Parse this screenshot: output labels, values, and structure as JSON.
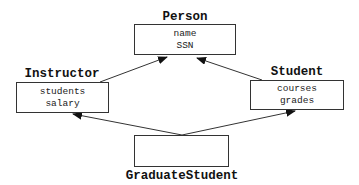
{
  "diagram": {
    "type": "class-inheritance",
    "classes": [
      {
        "id": "person",
        "name": "Person",
        "attributes": [
          "name",
          "SSN"
        ]
      },
      {
        "id": "instructor",
        "name": "Instructor",
        "attributes": [
          "students",
          "salary"
        ]
      },
      {
        "id": "student",
        "name": "Student",
        "attributes": [
          "courses",
          "grades"
        ]
      },
      {
        "id": "graduate_student",
        "name": "GraduateStudent",
        "attributes": []
      }
    ],
    "edges": [
      {
        "from": "Instructor",
        "to": "Person",
        "kind": "inherits"
      },
      {
        "from": "Student",
        "to": "Person",
        "kind": "inherits"
      },
      {
        "from": "GraduateStudent",
        "to": "Instructor",
        "kind": "inherits"
      },
      {
        "from": "GraduateStudent",
        "to": "Student",
        "kind": "inherits"
      }
    ],
    "colors": {
      "line": "#333333",
      "text": "#111111",
      "background": "#ffffff"
    }
  }
}
